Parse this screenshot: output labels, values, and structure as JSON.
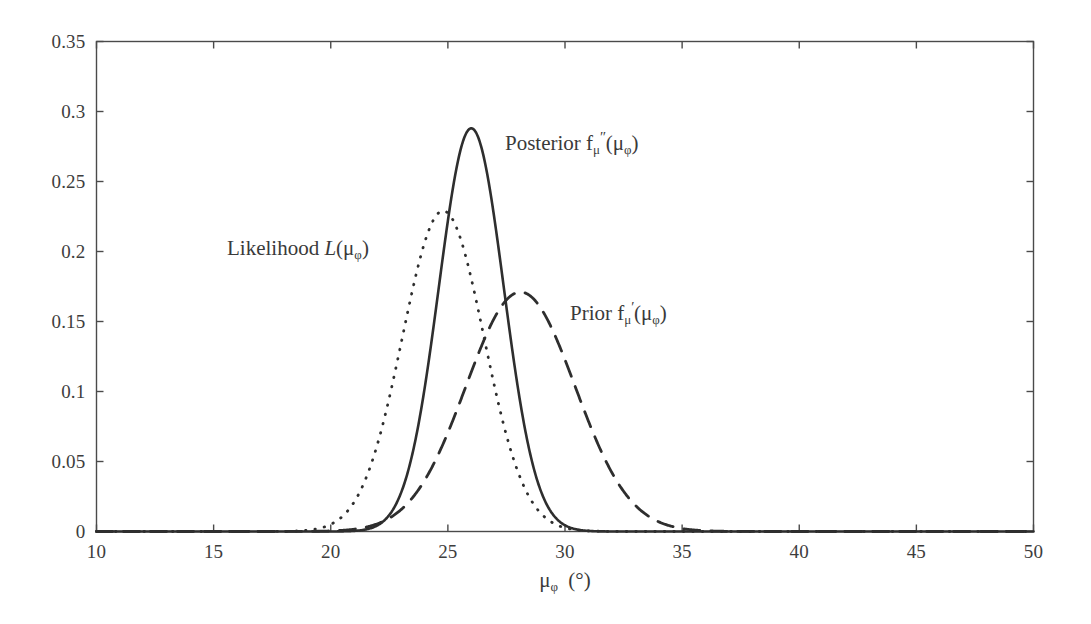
{
  "figure": {
    "background_color": "#ffffff",
    "line_color": "#2e2e2e",
    "axis_color": "#4a4a4a"
  },
  "axes": {
    "x_title_mu": "μ",
    "x_title_sub": "φ",
    "x_title_unit": "(°)",
    "x_ticks": [
      "10",
      "15",
      "20",
      "25",
      "30",
      "35",
      "40",
      "45",
      "50"
    ],
    "y_ticks": [
      "0",
      "0.05",
      "0.1",
      "0.15",
      "0.2",
      "0.25",
      "0.3",
      "0.35"
    ]
  },
  "annotations": {
    "likelihood": {
      "name": "likelihood-label",
      "prefix": "Likelihood ",
      "symbol": "L",
      "arg_open": "(",
      "arg_mu": "μ",
      "arg_sub": "φ",
      "arg_close": ")",
      "x": 227,
      "y": 238
    },
    "posterior": {
      "name": "posterior-label",
      "prefix": "Posterior ",
      "symbol": "f",
      "sub": "μ",
      "prime": "″",
      "arg_open": "(",
      "arg_mu": "μ",
      "arg_sub": "φ",
      "arg_close": ")",
      "x": 505,
      "y": 133
    },
    "prior": {
      "name": "prior-label",
      "prefix": "Prior ",
      "symbol": "f",
      "sub": "μ",
      "prime": "′",
      "arg_open": "(",
      "arg_mu": "μ",
      "arg_sub": "φ",
      "arg_close": ")",
      "x": 570,
      "y": 303
    }
  },
  "chart_data": {
    "type": "line",
    "title": "",
    "xlabel": "μ_φ (°)",
    "ylabel": "",
    "xlim": [
      10,
      50
    ],
    "ylim": [
      0,
      0.35
    ],
    "xticks": [
      10,
      15,
      20,
      25,
      30,
      35,
      40,
      45,
      50
    ],
    "yticks": [
      0,
      0.05,
      0.1,
      0.15,
      0.2,
      0.25,
      0.3,
      0.35
    ],
    "grid": false,
    "legend": "inline-annotations",
    "series": [
      {
        "name": "Likelihood L(μ_φ)",
        "style": "dotted",
        "distribution": "gaussian",
        "mean": 24.8,
        "sigma": 1.74,
        "peak": 0.229,
        "x": [
          10,
          12,
          14,
          16,
          18,
          19,
          20,
          20.5,
          21,
          21.5,
          22,
          22.5,
          23,
          23.5,
          24,
          24.5,
          24.8,
          25,
          25.5,
          26,
          26.5,
          27,
          27.5,
          28,
          28.5,
          29,
          29.5,
          30,
          30.5,
          31,
          32,
          33,
          34,
          35,
          37,
          40,
          45,
          50
        ],
        "y": [
          0,
          0,
          0,
          0,
          0.0003,
          0.0013,
          0.005,
          0.0091,
          0.0157,
          0.0254,
          0.0389,
          0.0564,
          0.0774,
          0.1005,
          0.1237,
          0.1446,
          0.1547,
          0.1607,
          0.1708,
          0.1727,
          0.1661,
          0.1522,
          0.1327,
          0.1097,
          0.0858,
          0.0635,
          0.0445,
          0.0295,
          0.0185,
          0.011,
          0.0033,
          0.0008,
          0.0002,
          0,
          0,
          0,
          0,
          0
        ],
        "y_scaled_note": "values plotted are the gaussian scaled to peak 0.229"
      },
      {
        "name": "Posterior f''_μ(μ_φ)",
        "style": "solid",
        "distribution": "gaussian",
        "mean": 26.0,
        "sigma": 1.385,
        "peak": 0.288,
        "x": [
          10,
          14,
          18,
          20,
          21,
          21.5,
          22,
          22.5,
          23,
          23.5,
          24,
          24.5,
          25,
          25.5,
          26,
          26.5,
          27,
          27.5,
          28,
          28.5,
          29,
          29.5,
          30,
          30.5,
          31,
          31.5,
          32,
          33,
          34,
          35,
          40,
          45,
          50
        ],
        "y": [
          0,
          0,
          0,
          0.0002,
          0.0011,
          0.0023,
          0.0047,
          0.0089,
          0.0159,
          0.0268,
          0.0427,
          0.0641,
          0.0909,
          0.1216,
          0.1534,
          0.1826,
          0.2053,
          0.2183,
          0.2201,
          0.2113,
          0.1941,
          0.1715,
          0.1466,
          0.1219,
          0.0989,
          0.0783,
          0.0604,
          0.0327,
          0.0152,
          0.006,
          0,
          0,
          0
        ],
        "y_scaled_note": "values plotted are the gaussian scaled to peak 0.288"
      },
      {
        "name": "Prior f'_μ(μ_φ)",
        "style": "dashed",
        "distribution": "gaussian",
        "mean": 28.1,
        "sigma": 2.33,
        "peak": 0.171,
        "x": [
          10,
          14,
          18,
          20,
          21,
          22,
          23,
          24,
          25,
          26,
          27,
          28,
          28.1,
          29,
          30,
          31,
          32,
          33,
          34,
          35,
          36,
          38,
          40,
          45,
          50
        ],
        "y": [
          0,
          0,
          0.0002,
          0.0009,
          0.0021,
          0.0045,
          0.0091,
          0.0171,
          0.0299,
          0.0487,
          0.0739,
          0.1044,
          0.1058,
          0.1376,
          0.1694,
          0.1956,
          0.2114,
          0.2133,
          0.2013,
          0.1777,
          0.1469,
          0.0842,
          0.0383,
          0.0021,
          0
        ],
        "y_scaled_note": "values plotted are the gaussian scaled to peak 0.171"
      }
    ]
  }
}
